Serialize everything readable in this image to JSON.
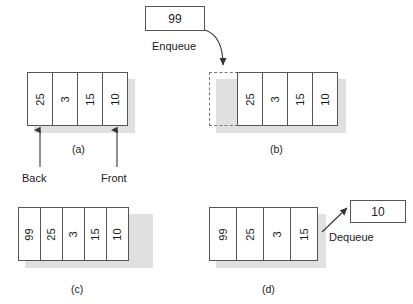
{
  "figure": {
    "title_visible": false,
    "panels": [
      {
        "id": "a",
        "caption": "(a)",
        "cells": [
          "25",
          "3",
          "15",
          "10"
        ],
        "pointers": [
          {
            "name": "back",
            "label": "Back",
            "target_cell_index": 0
          },
          {
            "name": "front",
            "label": "Front",
            "target_cell_index": 3
          }
        ]
      },
      {
        "id": "b",
        "caption": "(b)",
        "empty_slot": true,
        "cells": [
          "25",
          "3",
          "15",
          "10"
        ]
      },
      {
        "id": "c",
        "caption": "(c)",
        "cells": [
          "99",
          "25",
          "3",
          "15",
          "10"
        ]
      },
      {
        "id": "d",
        "caption": "(d)",
        "cells": [
          "99",
          "25",
          "3",
          "15"
        ]
      }
    ],
    "operations": [
      {
        "name": "enqueue",
        "label": "Enqueue",
        "value": "99",
        "direction": "into-queue"
      },
      {
        "name": "dequeue",
        "label": "Dequeue",
        "value": "10",
        "direction": "out-of-queue"
      }
    ],
    "colors": {
      "cell_border": "#555555",
      "cell_fill": "#ffffff",
      "shadow": "#e0e0e0",
      "text": "#1a1a1a",
      "dashed_border": "#777777"
    }
  }
}
